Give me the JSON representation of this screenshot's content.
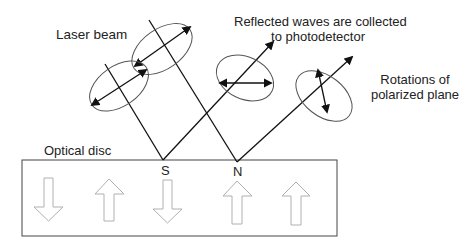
{
  "labels": {
    "laser_beam": "Laser beam",
    "reflected_line1": "Reflected waves are collected",
    "reflected_line2": "to photodetector",
    "rotations_line1": "Rotations of",
    "rotations_line2": "polarized plane",
    "optical_disc": "Optical disc",
    "pole_s": "S",
    "pole_n": "N"
  },
  "disc": {
    "magnetization_arrows": [
      "down",
      "up",
      "down",
      "up",
      "up"
    ]
  },
  "colors": {
    "line": "#222222",
    "ellipse": "#555555",
    "disc_arrow": "#b0b0b0"
  }
}
